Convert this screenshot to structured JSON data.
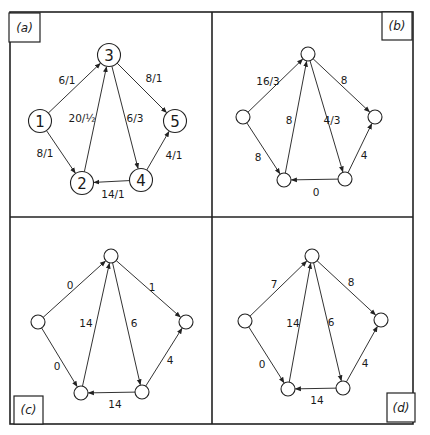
{
  "figure": {
    "frame": {
      "x1": 10,
      "y1": 12,
      "x2": 413,
      "y2": 424,
      "mid_x": 212,
      "mid_y": 217
    }
  },
  "panels": [
    {
      "id": "a",
      "label": "(a)",
      "label_box": {
        "x": 9,
        "y": 13,
        "w": 31,
        "h": 29
      },
      "node_radius": 11.5,
      "show_node_numbers": true,
      "nodes": [
        {
          "id": "1",
          "label": "1",
          "x": 40,
          "y": 121
        },
        {
          "id": "2",
          "label": "2",
          "x": 82,
          "y": 183
        },
        {
          "id": "3",
          "label": "3",
          "x": 109,
          "y": 55
        },
        {
          "id": "4",
          "label": "4",
          "x": 141,
          "y": 180
        },
        {
          "id": "5",
          "label": "5",
          "x": 175,
          "y": 121
        }
      ],
      "edges": [
        {
          "from": "1",
          "to": "3",
          "label": "6/1",
          "lx": 67,
          "ly": 80
        },
        {
          "from": "1",
          "to": "2",
          "label": "8/1",
          "lx": 45,
          "ly": 153
        },
        {
          "from": "2",
          "to": "3",
          "label": "20/½",
          "lx": 82,
          "ly": 118
        },
        {
          "from": "3",
          "to": "4",
          "label": "6/3",
          "lx": 135,
          "ly": 118
        },
        {
          "from": "3",
          "to": "5",
          "label": "8/1",
          "lx": 154,
          "ly": 78
        },
        {
          "from": "4",
          "to": "5",
          "label": "4/1",
          "lx": 174,
          "ly": 155
        },
        {
          "from": "4",
          "to": "2",
          "label": "14/1",
          "lx": 113,
          "ly": 194
        }
      ]
    },
    {
      "id": "b",
      "label": "(b)",
      "label_box": {
        "x": 382,
        "y": 12,
        "w": 30,
        "h": 28
      },
      "node_radius": 7,
      "show_node_numbers": false,
      "nodes": [
        {
          "id": "1",
          "label": "",
          "x": 243,
          "y": 117
        },
        {
          "id": "2",
          "label": "",
          "x": 284,
          "y": 180
        },
        {
          "id": "3",
          "label": "",
          "x": 308,
          "y": 54
        },
        {
          "id": "4",
          "label": "",
          "x": 345,
          "y": 179
        },
        {
          "id": "5",
          "label": "",
          "x": 375,
          "y": 117
        }
      ],
      "edges": [
        {
          "from": "1",
          "to": "3",
          "label": "16/3",
          "lx": 268,
          "ly": 81
        },
        {
          "from": "1",
          "to": "2",
          "label": "8",
          "lx": 258,
          "ly": 157
        },
        {
          "from": "2",
          "to": "3",
          "label": "8",
          "lx": 289,
          "ly": 120
        },
        {
          "from": "3",
          "to": "4",
          "label": "4/3",
          "lx": 332,
          "ly": 120
        },
        {
          "from": "3",
          "to": "5",
          "label": "8",
          "lx": 344,
          "ly": 80
        },
        {
          "from": "4",
          "to": "5",
          "label": "4",
          "lx": 364,
          "ly": 155
        },
        {
          "from": "4",
          "to": "2",
          "label": "0",
          "lx": 316,
          "ly": 192
        }
      ]
    },
    {
      "id": "c",
      "label": "(c)",
      "label_box": {
        "x": 14,
        "y": 396,
        "w": 29,
        "h": 28
      },
      "node_radius": 7,
      "show_node_numbers": false,
      "nodes": [
        {
          "id": "1",
          "label": "",
          "x": 38,
          "y": 322
        },
        {
          "id": "2",
          "label": "",
          "x": 81,
          "y": 393
        },
        {
          "id": "3",
          "label": "",
          "x": 111,
          "y": 256
        },
        {
          "id": "4",
          "label": "",
          "x": 142,
          "y": 392
        },
        {
          "id": "5",
          "label": "",
          "x": 186,
          "y": 322
        }
      ],
      "edges": [
        {
          "from": "1",
          "to": "3",
          "label": "0",
          "lx": 70,
          "ly": 285
        },
        {
          "from": "1",
          "to": "2",
          "label": "0",
          "lx": 57,
          "ly": 366
        },
        {
          "from": "2",
          "to": "3",
          "label": "14",
          "lx": 86,
          "ly": 323
        },
        {
          "from": "3",
          "to": "4",
          "label": "6",
          "lx": 134,
          "ly": 323
        },
        {
          "from": "3",
          "to": "5",
          "label": "1",
          "lx": 152,
          "ly": 287
        },
        {
          "from": "4",
          "to": "5",
          "label": "4",
          "lx": 170,
          "ly": 360
        },
        {
          "from": "4",
          "to": "2",
          "label": "14",
          "lx": 115,
          "ly": 404
        }
      ]
    },
    {
      "id": "d",
      "label": "(d)",
      "label_box": {
        "x": 387,
        "y": 393,
        "w": 28,
        "h": 29
      },
      "node_radius": 7,
      "show_node_numbers": false,
      "nodes": [
        {
          "id": "1",
          "label": "",
          "x": 245,
          "y": 321
        },
        {
          "id": "2",
          "label": "",
          "x": 288,
          "y": 389
        },
        {
          "id": "3",
          "label": "",
          "x": 312,
          "y": 256
        },
        {
          "id": "4",
          "label": "",
          "x": 343,
          "y": 388
        },
        {
          "id": "5",
          "label": "",
          "x": 381,
          "y": 320
        }
      ],
      "edges": [
        {
          "from": "1",
          "to": "3",
          "label": "7",
          "lx": 274,
          "ly": 284
        },
        {
          "from": "1",
          "to": "2",
          "label": "0",
          "lx": 262,
          "ly": 364
        },
        {
          "from": "2",
          "to": "3",
          "label": "14",
          "lx": 293,
          "ly": 323
        },
        {
          "from": "3",
          "to": "4",
          "label": "6",
          "lx": 331,
          "ly": 322
        },
        {
          "from": "3",
          "to": "5",
          "label": "8",
          "lx": 351,
          "ly": 282
        },
        {
          "from": "4",
          "to": "5",
          "label": "4",
          "lx": 365,
          "ly": 363
        },
        {
          "from": "4",
          "to": "2",
          "label": "14",
          "lx": 317,
          "ly": 400
        }
      ]
    }
  ]
}
